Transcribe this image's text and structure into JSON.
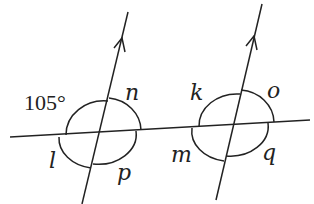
{
  "diagram": {
    "type": "parallel lines cut by transversal",
    "given_angle": "105°",
    "labels": {
      "n": "n",
      "l": "l",
      "p": "p",
      "k": "k",
      "o": "o",
      "m": "m",
      "q": "q"
    },
    "colors": {
      "stroke": "#222222",
      "background": "#ffffff"
    }
  }
}
